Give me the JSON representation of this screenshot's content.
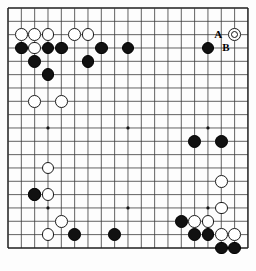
{
  "diagram": {
    "kind": "go-board-problem-diagram",
    "board_size": 19,
    "background_color": "#fdfdfd",
    "line_color": "#3a3a3a",
    "border_color": "#1e1e1e",
    "black_color": "#111111",
    "white_color": "#ffffff",
    "geometry": {
      "origin_x": 8,
      "origin_y": 8,
      "spacing": 13.33,
      "stone_radius": 6.4,
      "hoshi_radius": 1.6
    },
    "hoshi_points": [
      [
        4,
        4
      ],
      [
        10,
        4
      ],
      [
        16,
        4
      ],
      [
        4,
        10
      ],
      [
        10,
        10
      ],
      [
        16,
        10
      ],
      [
        4,
        16
      ],
      [
        10,
        16
      ],
      [
        16,
        16
      ]
    ],
    "black_stones": [
      [
        2,
        4
      ],
      [
        4,
        4
      ],
      [
        5,
        4
      ],
      [
        8,
        4
      ],
      [
        10,
        4
      ],
      [
        16,
        4
      ],
      [
        3,
        5
      ],
      [
        7,
        5
      ],
      [
        4,
        6
      ],
      [
        15,
        11
      ],
      [
        17,
        11
      ],
      [
        3,
        15
      ],
      [
        14,
        17
      ],
      [
        2,
        4
      ]
    ],
    "white_stones": [
      [
        2,
        3
      ],
      [
        3,
        3
      ],
      [
        4,
        3
      ],
      [
        6,
        3
      ],
      [
        7,
        3
      ],
      [
        18,
        3
      ],
      [
        3,
        4
      ],
      [
        3,
        8
      ],
      [
        5,
        8
      ],
      [
        4,
        13
      ],
      [
        3,
        15
      ],
      [
        4,
        15
      ],
      [
        5,
        17
      ],
      [
        4,
        18
      ],
      [
        17,
        14
      ],
      [
        17,
        16
      ]
    ],
    "marked_white_stone": [
      18,
      3
    ],
    "labels": [
      {
        "text": "A",
        "col": 17,
        "row": 3,
        "offset_x": -4,
        "offset_y": 0
      },
      {
        "text": "B",
        "col": 17,
        "row": 4,
        "offset_x": 4,
        "offset_y": 0
      }
    ],
    "label_a": "A",
    "label_b": "B"
  },
  "chart_data": {
    "type": "table",
    "columns": [
      "color",
      "column",
      "row"
    ],
    "black": [
      [
        2,
        4
      ],
      [
        4,
        4
      ],
      [
        5,
        4
      ],
      [
        8,
        4
      ],
      [
        10,
        4
      ],
      [
        16,
        4
      ],
      [
        3,
        5
      ],
      [
        7,
        5
      ],
      [
        4,
        6
      ],
      [
        15,
        11
      ],
      [
        17,
        11
      ],
      [
        3,
        15
      ],
      [
        14,
        17
      ],
      [
        15,
        18
      ],
      [
        16,
        18
      ],
      [
        6,
        18
      ],
      [
        9,
        18
      ],
      [
        17,
        19
      ],
      [
        18,
        19
      ]
    ],
    "white": [
      [
        2,
        3
      ],
      [
        3,
        3
      ],
      [
        4,
        3
      ],
      [
        6,
        3
      ],
      [
        7,
        3
      ],
      [
        18,
        3
      ],
      [
        3,
        4
      ],
      [
        3,
        8
      ],
      [
        5,
        8
      ],
      [
        4,
        13
      ],
      [
        3,
        15
      ],
      [
        4,
        15
      ],
      [
        5,
        17
      ],
      [
        4,
        18
      ],
      [
        17,
        14
      ],
      [
        17,
        16
      ],
      [
        15,
        17
      ],
      [
        16,
        17
      ],
      [
        17,
        18
      ],
      [
        18,
        18
      ]
    ]
  }
}
